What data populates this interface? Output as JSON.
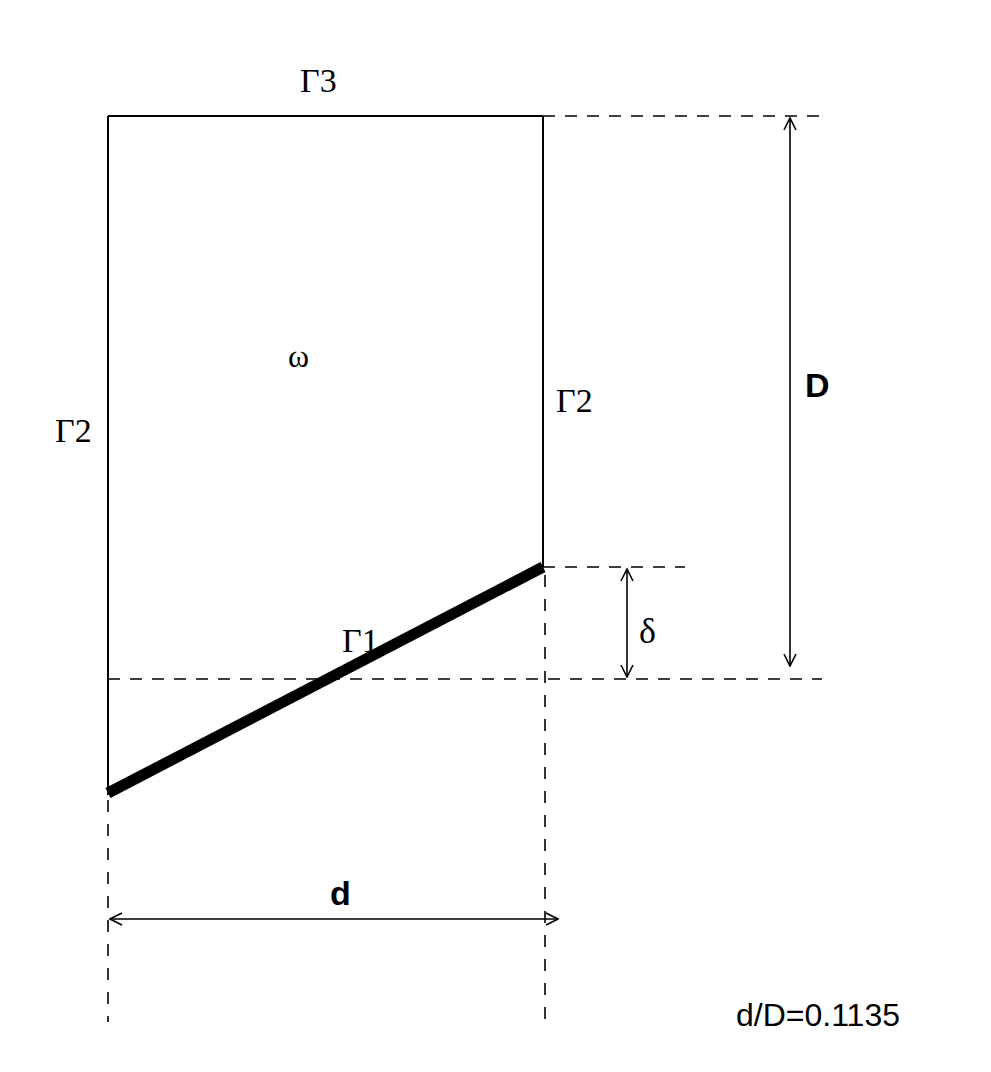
{
  "diagram": {
    "labels": {
      "gamma3": "Γ3",
      "gamma2_left": "Γ2",
      "gamma2_right": "Γ2",
      "gamma1": "Γ1",
      "omega": "ω",
      "D": "D",
      "delta": "δ",
      "d": "d",
      "ratio": "d/D=0.1135"
    },
    "colors": {
      "stroke": "#000000",
      "background": "#ffffff"
    }
  }
}
